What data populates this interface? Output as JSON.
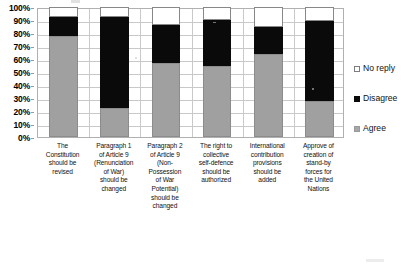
{
  "chart_data": {
    "type": "bar",
    "subtype": "stacked-column-100",
    "title": "",
    "xlabel": "",
    "ylabel": "",
    "ylim": [
      0,
      100
    ],
    "ytick_labels": [
      "0%",
      "10%",
      "20%",
      "30%",
      "40%",
      "50%",
      "60%",
      "70%",
      "80%",
      "90%",
      "100%"
    ],
    "ytick_values": [
      0,
      10,
      20,
      30,
      40,
      50,
      60,
      70,
      80,
      90,
      100
    ],
    "grid": true,
    "legend_position": "right",
    "categories": [
      "The Constitution should be revised",
      "Paragraph 1 of Article 9 (Renunciation of War) should be changed",
      "Paragraph 2 of Article 9 (Non-Possession of War Potential) should be changed",
      "The right to collective self-defence should be authorized",
      "International contribution provisions should be added",
      "Approve of creation of stand-by forces for the United Nations"
    ],
    "category_lines": [
      [
        "The",
        "Constitution",
        "should be",
        "revised"
      ],
      [
        "Paragraph 1",
        "of Article 9",
        "(Renunciation",
        "of War)",
        "should be",
        "changed"
      ],
      [
        "Paragraph 2",
        "of Article 9",
        "(Non-",
        "Possession",
        "of War",
        "Potential)",
        "should be",
        "changed"
      ],
      [
        "The right to",
        "collective",
        "self-defence",
        "should be",
        "authorized"
      ],
      [
        "International",
        "contribution",
        "provisions",
        "should be",
        "added"
      ],
      [
        "Approve of",
        "creation of",
        "stand-by",
        "forces for",
        "the United",
        "Nations"
      ]
    ],
    "series": [
      {
        "name": "Agree",
        "color": "#a0a0a0",
        "values": [
          78,
          22,
          57,
          55,
          64,
          28
        ]
      },
      {
        "name": "Disagree",
        "color": "#0a0a0a",
        "values": [
          14,
          70,
          29,
          35,
          21,
          61
        ]
      },
      {
        "name": "No reply",
        "color": "#ffffff",
        "values": [
          8,
          8,
          14,
          10,
          15,
          11
        ]
      }
    ],
    "legend_order": [
      "No reply",
      "Disagree",
      "Agree"
    ]
  },
  "legend": {
    "items": [
      {
        "label": "No reply",
        "swatch": "noreply-swatch-icon"
      },
      {
        "label": "Disagree",
        "swatch": "disagree-swatch-icon"
      },
      {
        "label": "Agree",
        "swatch": "agree-swatch-icon"
      }
    ]
  }
}
